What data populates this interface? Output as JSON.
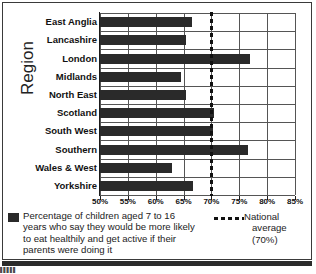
{
  "chart_data": {
    "type": "bar",
    "orientation": "horizontal",
    "title": "",
    "xlabel": "",
    "ylabel": "Region",
    "xlim": [
      50,
      85
    ],
    "xticks": [
      "50%",
      "55%",
      "60%",
      "65%",
      "70%",
      "75%",
      "80%",
      "85%"
    ],
    "xtick_values": [
      50,
      55,
      60,
      65,
      70,
      75,
      80,
      85
    ],
    "grid": true,
    "categories": [
      "East Anglia",
      "Lancashire",
      "London",
      "Midlands",
      "North East",
      "Scotland",
      "South West",
      "Southern",
      "Wales & West",
      "Yorkshire"
    ],
    "values": [
      66.5,
      65.5,
      77,
      64.5,
      65.5,
      70.5,
      70.2,
      76.5,
      63,
      66.7
    ],
    "series": [
      {
        "name": "Percentage of children aged 7 to 16 years who say they would be more likely to eat healthily and get active if their parents were doing it",
        "values": [
          66.5,
          65.5,
          77,
          64.5,
          65.5,
          70.5,
          70.2,
          76.5,
          63,
          66.7
        ]
      }
    ],
    "reference_line": {
      "label": "National average (70%)",
      "value": 70,
      "style": "dashed"
    },
    "legend_position": "below",
    "bar_color": "#2a2a2a",
    "grid_color": "#555555"
  },
  "legend": {
    "series_label_line1": "Percentage of children aged 7 to 16",
    "series_label_line2": "years  who say they would be more likely",
    "series_label_line3": "to eat healthily and get active if their",
    "series_label_line4": "parents were doing it",
    "average_label_line1": "National",
    "average_label_line2": "average (70%)"
  },
  "axis": {
    "y_title": "Region"
  },
  "footer": {
    "corner_marks": "▌▌▌▌▌"
  }
}
